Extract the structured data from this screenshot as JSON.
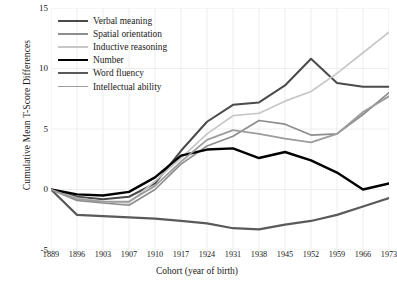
{
  "chart_data": {
    "type": "line",
    "title": "",
    "xlabel": "Cohort (year of birth)",
    "ylabel": "Cumulative Mean T-Score Differences",
    "categories": [
      1889,
      1896,
      1903,
      1907,
      1910,
      1917,
      1924,
      1931,
      1938,
      1945,
      1952,
      1959,
      1966,
      1973
    ],
    "xtick_labels": [
      "1889",
      "1896",
      "1903",
      "1907",
      "1910",
      "1917",
      "1924",
      "1931",
      "1938",
      "1945",
      "1952",
      "1959",
      "1966",
      "1973"
    ],
    "ytick_labels": [
      "15",
      "10",
      "5",
      "0",
      "-5"
    ],
    "ytick_values": [
      15,
      10,
      5,
      0,
      -5
    ],
    "ylim": [
      -5,
      15
    ],
    "grid": true,
    "legend_position": "upper-left",
    "series": [
      {
        "name": "Verbal meaning",
        "color": "#4a4a4a",
        "width": 2.0,
        "values": [
          0.0,
          -0.6,
          -0.8,
          -0.6,
          0.5,
          3.2,
          5.6,
          7.0,
          7.2,
          8.6,
          10.8,
          8.8,
          8.5,
          8.5
        ]
      },
      {
        "name": "Spatial orientation",
        "color": "#8d8d8d",
        "width": 1.7,
        "values": [
          0.0,
          -0.9,
          -1.1,
          -1.3,
          0.0,
          2.1,
          3.6,
          4.4,
          5.7,
          5.4,
          4.5,
          4.6,
          6.2,
          8.0
        ]
      },
      {
        "name": "Inductive reasoning",
        "color": "#c7c7c7",
        "width": 1.7,
        "values": [
          0.0,
          -0.7,
          -1.0,
          -1.1,
          0.7,
          2.6,
          4.6,
          6.1,
          6.3,
          7.3,
          8.1,
          9.6,
          11.3,
          13.0
        ]
      },
      {
        "name": "Number",
        "color": "#000000",
        "width": 2.4,
        "values": [
          0.0,
          -0.4,
          -0.5,
          -0.2,
          1.0,
          2.8,
          3.3,
          3.4,
          2.6,
          3.1,
          2.4,
          1.4,
          0.0,
          0.5
        ]
      },
      {
        "name": "Word fluency",
        "color": "#5a5a5a",
        "width": 2.2,
        "values": [
          0.0,
          -2.1,
          -2.2,
          -2.3,
          -2.4,
          -2.6,
          -2.8,
          -3.2,
          -3.3,
          -2.9,
          -2.6,
          -2.1,
          -1.4,
          -0.7
        ]
      },
      {
        "name": "Intellectual ability",
        "color": "#9c9c9c",
        "width": 1.8,
        "values": [
          0.0,
          -0.8,
          -1.0,
          -1.0,
          0.3,
          2.3,
          4.1,
          4.9,
          4.6,
          4.2,
          3.9,
          4.6,
          6.4,
          7.7
        ]
      }
    ]
  }
}
